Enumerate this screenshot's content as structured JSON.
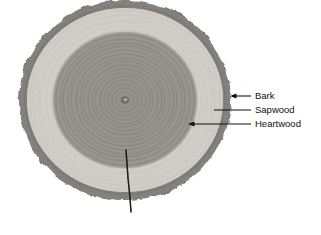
{
  "figure": {
    "background_color": "#ffffff"
  },
  "specimen": {
    "name": "tree-cross-section",
    "center": {
      "x": 125,
      "y": 100
    },
    "bounds": {
      "left": 25,
      "top": 15,
      "right": 237,
      "bottom": 215
    },
    "regions": [
      {
        "id": "bark",
        "label": "Bark",
        "color": "#8e8b86",
        "outer_radius_x": 106,
        "outer_radius_y": 100
      },
      {
        "id": "sapwood",
        "label": "Sapwood",
        "color": "#d9d6d1",
        "outer_radius_x": 98,
        "outer_radius_y": 92
      },
      {
        "id": "heartwood",
        "label": "Heartwood",
        "color": "#9c9992",
        "outer_radius_x": 72,
        "outer_radius_y": 68
      },
      {
        "id": "pith",
        "label": "Pith",
        "color": "#6f6c67",
        "outer_radius_x": 5,
        "outer_radius_y": 4
      }
    ],
    "growth_rings_visible": true,
    "radial_crack": {
      "id": "radial-crack",
      "from": {
        "x": 126,
        "y": 150
      },
      "to": {
        "x": 131,
        "y": 212
      }
    }
  },
  "annotations": {
    "leader_color": "#111111",
    "items": [
      {
        "id": "bark",
        "label": "Bark",
        "tip": {
          "x": 232,
          "y": 96
        },
        "elbow": {
          "x": 250,
          "y": 96
        },
        "text": {
          "x": 255,
          "y": 99
        },
        "arrow": true
      },
      {
        "id": "sapwood",
        "label": "Sapwood",
        "tip": {
          "x": 214,
          "y": 110
        },
        "elbow": {
          "x": 250,
          "y": 110
        },
        "text": {
          "x": 255,
          "y": 113
        },
        "arrow": false
      },
      {
        "id": "heartwood",
        "label": "Heartwood",
        "tip": {
          "x": 190,
          "y": 124
        },
        "elbow": {
          "x": 250,
          "y": 124
        },
        "text": {
          "x": 255,
          "y": 127
        },
        "arrow": true
      }
    ]
  }
}
